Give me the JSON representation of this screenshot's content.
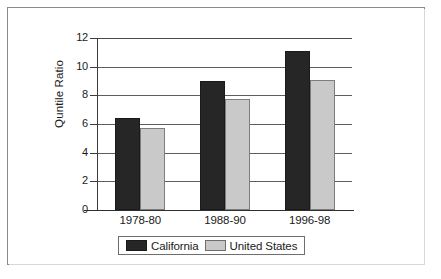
{
  "chart_data": {
    "type": "bar",
    "title": "",
    "xlabel": "",
    "ylabel": "Quntile Ratio",
    "categories": [
      "1978-80",
      "1988-90",
      "1996-98"
    ],
    "series": [
      {
        "name": "California",
        "values": [
          6.4,
          9.0,
          11.1
        ],
        "color": "#262626"
      },
      {
        "name": "United States",
        "values": [
          5.7,
          7.75,
          9.1
        ],
        "color": "#c9c9c9"
      }
    ],
    "ylim": [
      0,
      12
    ],
    "yticks": [
      0,
      2,
      4,
      6,
      8,
      10,
      12
    ],
    "ytick_labels": [
      "0",
      "2",
      "4",
      "6",
      "8",
      "10",
      "12"
    ],
    "grid": true,
    "grid_axis": "y",
    "legend_position": "bottom",
    "frame": true
  },
  "legend": {
    "entries": [
      {
        "label": "California",
        "swatch": "black-swatch"
      },
      {
        "label": "United States",
        "swatch": "gray-swatch"
      }
    ]
  }
}
